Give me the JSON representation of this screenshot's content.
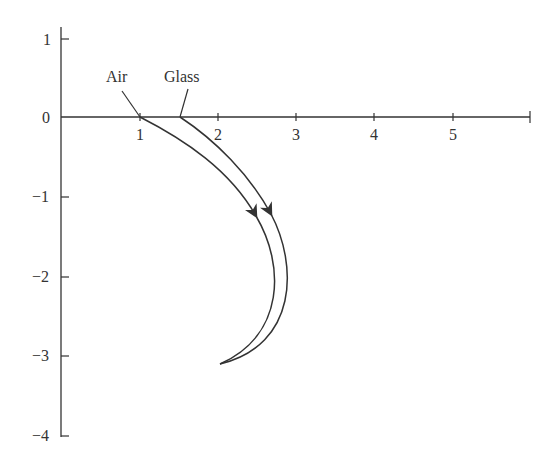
{
  "diagram": {
    "labels": {
      "air": "Air",
      "glass": "Glass"
    },
    "x_axis": {
      "ticks": [
        "1",
        "2",
        "3",
        "4",
        "5"
      ]
    },
    "y_axis": {
      "ticks": [
        "1",
        "0",
        "−1",
        "−2",
        "−3",
        "−4"
      ]
    },
    "colors": {
      "stroke": "#333333",
      "background": "#ffffff"
    }
  }
}
